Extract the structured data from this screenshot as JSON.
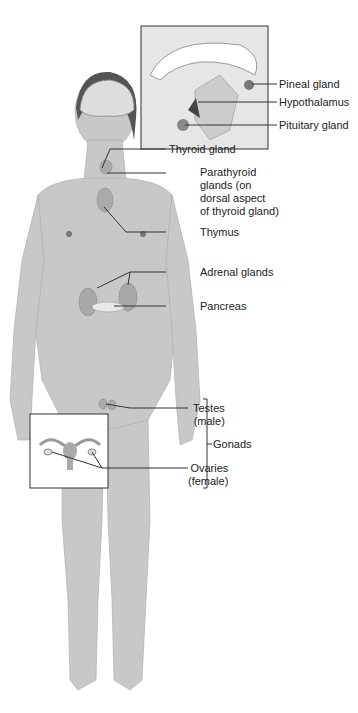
{
  "diagram": {
    "labels": {
      "pineal": "Pineal gland",
      "hypothalamus": "Hypothalamus",
      "pituitary": "Pituitary gland",
      "thyroid": "Thyroid gland",
      "parathyroid": "Parathyroid\nglands (on\ndorsal aspect\nof thyroid gland)",
      "thymus": "Thymus",
      "adrenal": "Adrenal glands",
      "pancreas": "Pancreas",
      "testes": "Testes\n(male)",
      "ovaries": "Ovaries\n(female)",
      "gonads": "Gonads"
    },
    "colors": {
      "body": "#c8c8c8",
      "body_shade": "#b4b4b4",
      "line": "#333333",
      "gland": "#9a9a9a"
    }
  }
}
